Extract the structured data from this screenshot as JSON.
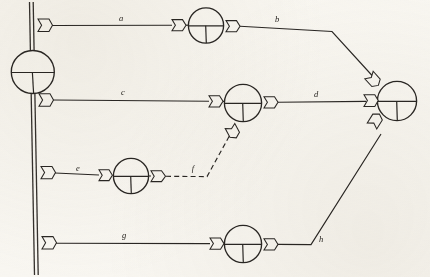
{
  "figure": {
    "background_color": "#fbfaf7",
    "ink_color": "#2a2724",
    "width": 430,
    "height": 277
  },
  "bus": {
    "name": "vertical-bus",
    "style": "double-line",
    "top": {
      "x": 30,
      "y": 2
    },
    "bottom": {
      "x": 35,
      "y": 275
    },
    "offset": 3.2
  },
  "nodes": [
    {
      "id": "n-bus",
      "label": "",
      "cx": 32,
      "cy": 72,
      "r": 21.5,
      "symbol": "circle-cross-bus"
    },
    {
      "id": "n-a",
      "label": "",
      "cx": 206,
      "cy": 25,
      "r": 17.5,
      "symbol": "circle-tee"
    },
    {
      "id": "n-c",
      "label": "",
      "cx": 243,
      "cy": 103,
      "r": 18.5,
      "symbol": "circle-tee"
    },
    {
      "id": "n-e",
      "label": "",
      "cx": 131,
      "cy": 176,
      "r": 17.5,
      "symbol": "circle-tee"
    },
    {
      "id": "n-g",
      "label": "",
      "cx": 243,
      "cy": 244,
      "r": 18.5,
      "symbol": "circle-tee"
    },
    {
      "id": "n-right",
      "label": "",
      "cx": 397,
      "cy": 101,
      "r": 19.5,
      "symbol": "circle-tee"
    }
  ],
  "branches": [
    {
      "id": "branch-a",
      "label": "a",
      "label_x": 121,
      "label_y": 21,
      "style": "solid",
      "from": "bus",
      "to": "n-a"
    },
    {
      "id": "branch-b",
      "label": "b",
      "label_x": 277,
      "label_y": 22,
      "style": "solid",
      "from": "n-a",
      "to": "n-right"
    },
    {
      "id": "branch-c",
      "label": "c",
      "label_x": 123,
      "label_y": 95,
      "style": "solid",
      "from": "bus",
      "to": "n-c"
    },
    {
      "id": "branch-d",
      "label": "d",
      "label_x": 316,
      "label_y": 97,
      "style": "solid",
      "from": "n-c",
      "to": "n-right"
    },
    {
      "id": "branch-e",
      "label": "e",
      "label_x": 78,
      "label_y": 171,
      "style": "solid",
      "from": "bus",
      "to": "n-e"
    },
    {
      "id": "branch-f",
      "label": "f",
      "label_x": 193,
      "label_y": 171,
      "style": "dashed",
      "from": "n-e",
      "to": "n-c"
    },
    {
      "id": "branch-g",
      "label": "g",
      "label_x": 124,
      "label_y": 238,
      "style": "solid",
      "from": "bus",
      "to": "n-g"
    },
    {
      "id": "branch-h",
      "label": "h",
      "label_x": 321,
      "label_y": 242,
      "style": "solid",
      "from": "n-g",
      "to": "n-right"
    }
  ],
  "connectors": [
    {
      "id": "conn-bus-a",
      "name": "flag-connector",
      "x": 38,
      "y": 24,
      "angle": 0,
      "dir": "right"
    },
    {
      "id": "conn-a-left",
      "name": "flag-connector",
      "x": 172,
      "y": 25,
      "angle": 0,
      "dir": "right"
    },
    {
      "id": "conn-a-right",
      "name": "flag-connector",
      "x": 226,
      "y": 26,
      "angle": 0,
      "dir": "right"
    },
    {
      "id": "conn-bus-c",
      "name": "flag-connector",
      "x": 39,
      "y": 99,
      "angle": 0,
      "dir": "right"
    },
    {
      "id": "conn-c-left",
      "name": "flag-connector",
      "x": 209,
      "y": 101,
      "angle": 0,
      "dir": "right"
    },
    {
      "id": "conn-c-right",
      "name": "flag-connector",
      "x": 264,
      "y": 102,
      "angle": 0,
      "dir": "right"
    },
    {
      "id": "conn-c-bottom",
      "name": "flag-connector",
      "x": 230,
      "y": 126,
      "angle": 52,
      "dir": "right"
    },
    {
      "id": "conn-bus-e",
      "name": "flag-connector",
      "x": 41,
      "y": 172,
      "angle": 0,
      "dir": "right"
    },
    {
      "id": "conn-e-left",
      "name": "flag-connector",
      "x": 99,
      "y": 175,
      "angle": 0,
      "dir": "right"
    },
    {
      "id": "conn-e-right",
      "name": "flag-connector",
      "x": 151,
      "y": 176,
      "angle": 0,
      "dir": "right"
    },
    {
      "id": "conn-bus-g",
      "name": "flag-connector",
      "x": 42,
      "y": 242,
      "angle": 0,
      "dir": "right"
    },
    {
      "id": "conn-g-left",
      "name": "flag-connector",
      "x": 210,
      "y": 243,
      "angle": 0,
      "dir": "right"
    },
    {
      "id": "conn-g-right",
      "name": "flag-connector",
      "x": 264,
      "y": 244,
      "angle": 0,
      "dir": "right"
    },
    {
      "id": "conn-right-top",
      "name": "flag-connector",
      "x": 372,
      "y": 77,
      "angle": 48,
      "dir": "right"
    },
    {
      "id": "conn-right-mid",
      "name": "flag-connector",
      "x": 366,
      "y": 100,
      "angle": 0,
      "dir": "right"
    },
    {
      "id": "conn-right-bot",
      "name": "flag-connector",
      "x": 375,
      "y": 128,
      "angle": -58,
      "dir": "right"
    }
  ]
}
